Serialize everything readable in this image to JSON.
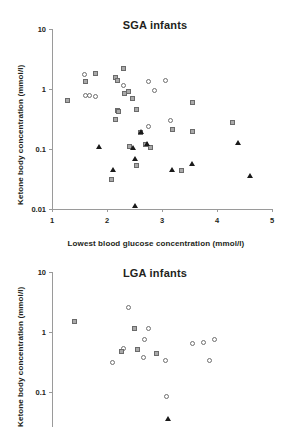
{
  "figure": {
    "ylabel": "Ketone body concentration (mmol/l)",
    "xlabel": "Lowest blood glucose concentration (mmol/l)"
  },
  "panels": [
    {
      "id": "sga",
      "title": "SGA infants"
    },
    {
      "id": "lga",
      "title": "LGA infants"
    }
  ],
  "ticks": {
    "y": [
      "10",
      "1",
      "0.1",
      "0.01"
    ],
    "y_lga": [
      "10",
      "1",
      "0.1"
    ],
    "x": [
      "1",
      "2",
      "3",
      "4",
      "5"
    ]
  },
  "chart_data": [
    {
      "type": "scatter",
      "title": "SGA infants",
      "xlabel": "Lowest blood glucose concentration (mmol/l)",
      "ylabel": "Ketone body concentration (mmol/l)",
      "xlim": [
        1,
        5
      ],
      "ylim": [
        0.01,
        10
      ],
      "yscale": "log",
      "xscale": "linear",
      "grid": false,
      "legend": "none",
      "series": [
        {
          "name": "open-circle",
          "marker": "circle-open",
          "points": [
            [
              1.6,
              1.7
            ],
            [
              1.62,
              0.75
            ],
            [
              1.7,
              0.74
            ],
            [
              1.8,
              0.73
            ],
            [
              2.32,
              1.08
            ],
            [
              2.78,
              1.3
            ],
            [
              3.08,
              1.32
            ],
            [
              2.88,
              0.92
            ],
            [
              2.78,
              0.23
            ],
            [
              3.18,
              0.29
            ],
            [
              3.2,
              0.2
            ]
          ]
        },
        {
          "name": "gray-square",
          "marker": "square-filled",
          "points": [
            [
              1.3,
              0.63
            ],
            [
              1.62,
              1.28
            ],
            [
              1.8,
              1.72
            ],
            [
              2.18,
              1.52
            ],
            [
              2.2,
              1.32
            ],
            [
              2.32,
              2.1
            ],
            [
              2.33,
              0.8
            ],
            [
              2.4,
              0.88
            ],
            [
              2.48,
              0.66
            ],
            [
              2.2,
              0.42
            ],
            [
              2.22,
              0.4
            ],
            [
              2.18,
              0.3
            ],
            [
              2.55,
              0.44
            ],
            [
              2.62,
              0.18
            ],
            [
              2.42,
              0.105
            ],
            [
              2.72,
              0.115
            ],
            [
              2.8,
              0.103
            ],
            [
              2.55,
              0.052
            ],
            [
              2.1,
              0.03
            ],
            [
              3.2,
              0.2
            ],
            [
              3.38,
              0.042
            ],
            [
              3.58,
              0.58
            ],
            [
              3.58,
              0.185
            ],
            [
              4.3,
              0.27
            ]
          ]
        },
        {
          "name": "black-triangle",
          "marker": "triangle-filled",
          "points": [
            [
              1.85,
              0.1
            ],
            [
              2.1,
              0.042
            ],
            [
              2.48,
              0.095
            ],
            [
              2.5,
              0.064
            ],
            [
              2.62,
              0.175
            ],
            [
              2.72,
              0.112
            ],
            [
              2.5,
              0.0105
            ],
            [
              3.18,
              0.042
            ],
            [
              3.55,
              0.053
            ],
            [
              4.38,
              0.118
            ],
            [
              4.6,
              0.033
            ]
          ]
        }
      ]
    },
    {
      "type": "scatter",
      "title": "LGA infants",
      "xlabel": "Lowest blood glucose concentration (mmol/l)",
      "ylabel": "Ketone body concentration (mmol/l)",
      "xlim": [
        1,
        5
      ],
      "ylim": [
        0.03,
        10
      ],
      "yscale": "log",
      "xscale": "linear",
      "grid": false,
      "legend": "none",
      "note": "panel is cropped at the bottom edge of the screenshot",
      "series": [
        {
          "name": "open-circle",
          "marker": "circle-open",
          "points": [
            [
              2.4,
              2.45
            ],
            [
              2.78,
              1.1
            ],
            [
              2.7,
              0.72
            ],
            [
              2.32,
              0.52
            ],
            [
              2.68,
              0.36
            ],
            [
              3.08,
              0.32
            ],
            [
              3.58,
              0.63
            ],
            [
              3.78,
              0.65
            ],
            [
              3.98,
              0.72
            ],
            [
              3.88,
              0.32
            ],
            [
              3.1,
              0.082
            ],
            [
              2.12,
              0.3
            ]
          ]
        },
        {
          "name": "gray-square",
          "marker": "square-filled",
          "points": [
            [
              1.42,
              1.42
            ],
            [
              2.52,
              1.08
            ],
            [
              2.28,
              0.46
            ],
            [
              2.58,
              0.5
            ],
            [
              2.92,
              0.42
            ]
          ]
        },
        {
          "name": "black-triangle",
          "marker": "triangle-filled",
          "points": [
            [
              3.1,
              0.033
            ]
          ]
        }
      ]
    }
  ]
}
